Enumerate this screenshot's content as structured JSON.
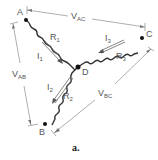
{
  "diagram": {
    "caption": "a.",
    "nodes": [
      {
        "id": "A",
        "label": "A"
      },
      {
        "id": "B",
        "label": "B"
      },
      {
        "id": "C",
        "label": "C"
      },
      {
        "id": "D",
        "label": "D"
      }
    ],
    "resistors": [
      {
        "id": "R1",
        "label": "R",
        "sub": "1",
        "from": "A",
        "to": "D"
      },
      {
        "id": "R2",
        "label": "R",
        "sub": "2",
        "from": "B",
        "to": "D"
      },
      {
        "id": "R3",
        "label": "R",
        "sub": "3",
        "from": "C",
        "to": "D"
      }
    ],
    "currents": [
      {
        "id": "I1",
        "label": "I",
        "sub": "1",
        "direction": "A to D"
      },
      {
        "id": "I2",
        "label": "I",
        "sub": "2",
        "direction": "D to B"
      },
      {
        "id": "I3",
        "label": "I",
        "sub": "3",
        "direction": "C to D"
      }
    ],
    "voltages": [
      {
        "id": "VAC",
        "label": "V",
        "sub": "AC"
      },
      {
        "id": "VAB",
        "label": "V",
        "sub": "AB"
      },
      {
        "id": "VBC",
        "label": "V",
        "sub": "BC"
      }
    ]
  }
}
